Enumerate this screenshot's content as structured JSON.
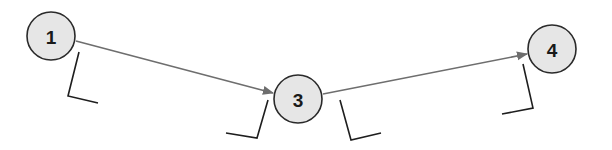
{
  "diagram": {
    "type": "network-diagram",
    "colors": {
      "node_fill": "#e6e6e6",
      "node_stroke": "#2a2a2a",
      "edge": "#6e6e6e",
      "bracket": "#1e1e1e",
      "background": "#ffffff"
    },
    "nodes": [
      {
        "id": "n1",
        "label": "1",
        "cx": 51,
        "cy": 36,
        "r": 24
      },
      {
        "id": "n3",
        "label": "3",
        "cx": 298,
        "cy": 99,
        "r": 24
      },
      {
        "id": "n4",
        "label": "4",
        "cx": 552,
        "cy": 49,
        "r": 24
      }
    ],
    "edges": [
      {
        "from": "1",
        "to": "3",
        "x1": 76,
        "y1": 41,
        "x2": 273,
        "y2": 93
      },
      {
        "from": "3",
        "to": "4",
        "x1": 323,
        "y1": 94,
        "x2": 527,
        "y2": 54
      }
    ],
    "blanks": [
      {
        "near": "1",
        "position": "below",
        "points": "79,52 68,96 98,103"
      },
      {
        "near": "3",
        "position": "left",
        "points": "268,100 257,138 226,133"
      },
      {
        "near": "3",
        "position": "right",
        "points": "340,100 351,140 381,133"
      },
      {
        "near": "4",
        "position": "below",
        "points": "523,64 533,108 502,114"
      }
    ]
  }
}
